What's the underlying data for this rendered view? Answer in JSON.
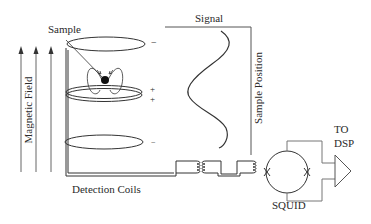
{
  "diagram": {
    "labels": {
      "sample": "Sample",
      "magnetic_field": "Magnetic Field",
      "signal": "Signal",
      "sample_position": "Sample Position",
      "detection_coils": "Detection Coils",
      "squid": "SQUID",
      "to": "TO",
      "dsp": "DSP"
    },
    "coil_polarities": {
      "top": "−",
      "middle_upper": "+",
      "middle_lower": "+",
      "bottom": "−"
    },
    "colors": {
      "line": "#333333",
      "field_arrow": "#555555",
      "text": "#2a2a2a"
    }
  }
}
